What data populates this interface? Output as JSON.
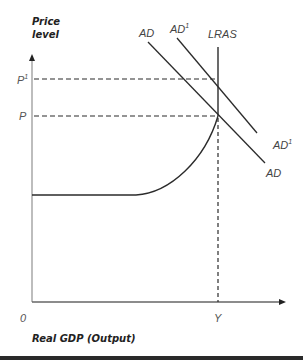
{
  "diagram": {
    "y_axis_title_line1": "Price",
    "y_axis_title_line2": "level",
    "x_axis_title": "Real GDP (Output)",
    "origin_label": "0",
    "y_ticks": [
      {
        "label": "P",
        "sup": "1"
      },
      {
        "label": "P",
        "sup": ""
      }
    ],
    "x_ticks": [
      {
        "label": "Y"
      }
    ],
    "curves": {
      "ad_top": "AD",
      "ad1_top": "AD",
      "ad1_top_sup": "1",
      "lras": "LRAS",
      "ad1_bottom": "AD",
      "ad1_bottom_sup": "1",
      "ad_bottom": "AD"
    },
    "colors": {
      "line": "#2b2b2b",
      "axis": "#999999",
      "label": "#555555"
    }
  }
}
